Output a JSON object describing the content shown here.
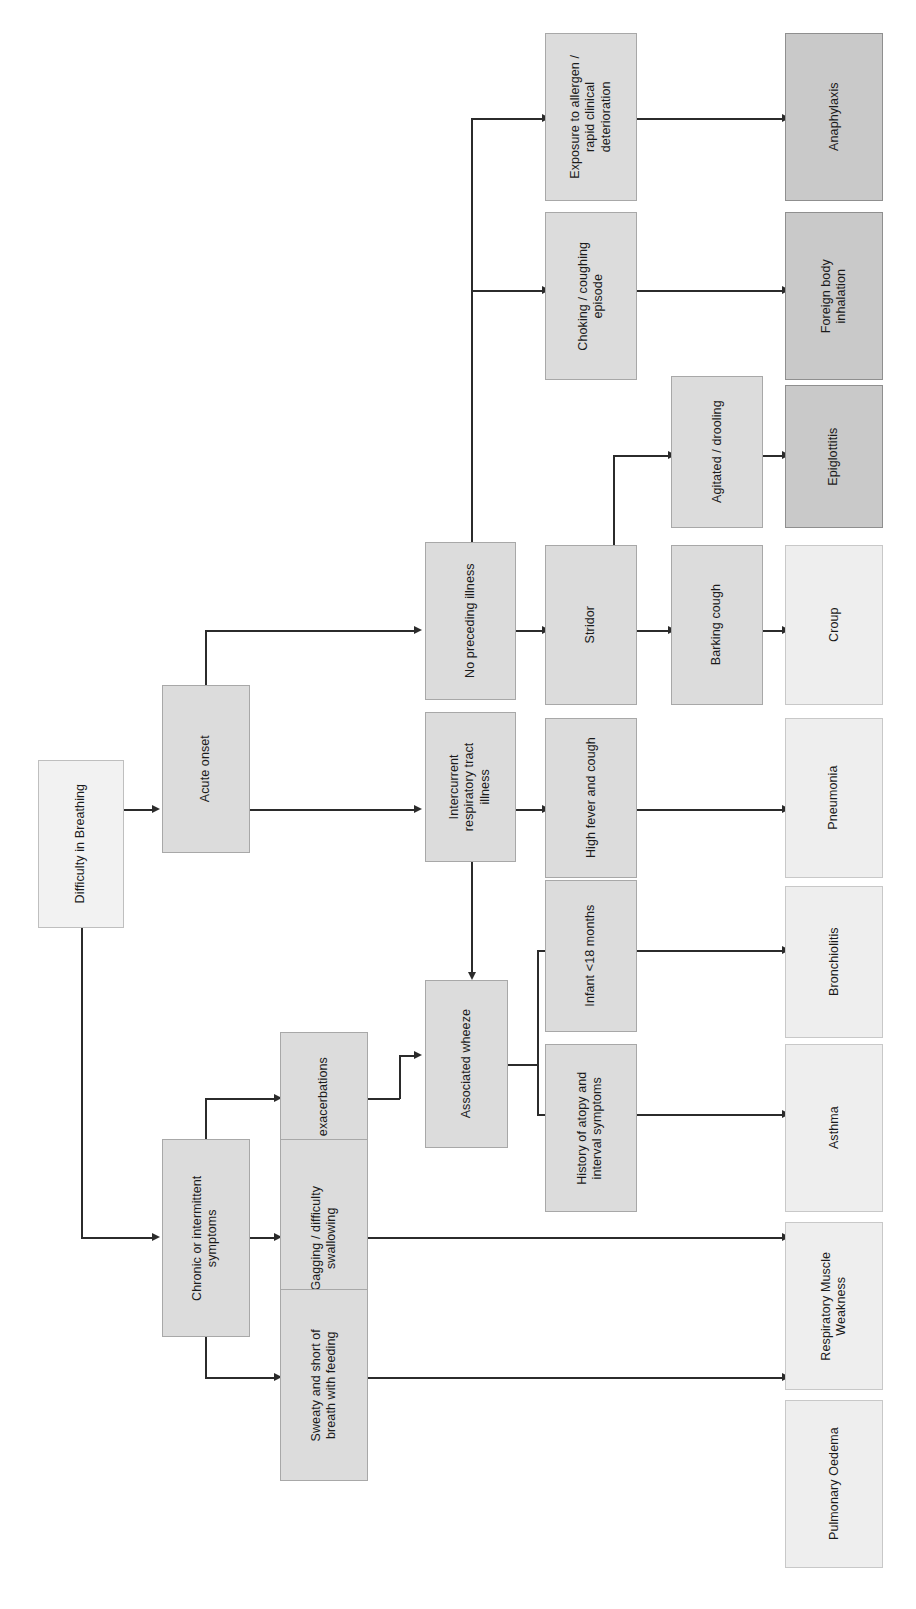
{
  "diagram": {
    "title": "Difficulty in Breathing",
    "orientation": "rotated-90-clockwise",
    "palette": {
      "root_fill": "#f2f2f2",
      "step_fill": "#dcdcdc",
      "outcome_light_fill": "#eeeeee",
      "outcome_dark_fill": "#c9c9c9",
      "border": "#a6a6a6",
      "connector": "#2b2b2b",
      "text": "#1a1a1a",
      "background": "#ffffff"
    },
    "nodes": {
      "root": {
        "label": "Difficulty in Breathing"
      },
      "acute_onset": {
        "label": "Acute onset"
      },
      "chronic": {
        "label": "Chronic or intermittent\nsymptoms"
      },
      "no_preceding": {
        "label": "No preceding illness"
      },
      "intercurrent": {
        "label": "Intercurrent\nrespiratory tract\nillness"
      },
      "acute_exac": {
        "label": "Acute exacerbations"
      },
      "gagging": {
        "label": "Gagging / difficulty\nswallowing"
      },
      "sweaty": {
        "label": "Sweaty and short of\nbreath with feeding"
      },
      "assoc_wheeze": {
        "label": "Associated wheeze"
      },
      "exposure": {
        "label": "Exposure to allergen /\nrapid clinical\ndeterioration"
      },
      "choking": {
        "label": "Choking / coughing\nepisode"
      },
      "stridor": {
        "label": "Stridor"
      },
      "high_fever": {
        "label": "High fever and cough"
      },
      "infant": {
        "label": "Infant <18 months"
      },
      "atopy": {
        "label": "History of atopy and\ninterval symptoms"
      },
      "agitated": {
        "label": "Agitated / drooling"
      },
      "barking": {
        "label": "Barking cough"
      },
      "anaphylaxis": {
        "label": "Anaphylaxis"
      },
      "foreign_body": {
        "label": "Foreign body\ninhalation"
      },
      "epiglottitis": {
        "label": "Epiglottitis"
      },
      "croup": {
        "label": "Croup"
      },
      "pneumonia": {
        "label": "Pneumonia"
      },
      "bronchiolitis": {
        "label": "Bronchiolitis"
      },
      "asthma": {
        "label": "Asthma"
      },
      "resp_muscle": {
        "label": "Respiratory Muscle\nWeakness"
      },
      "pulm_oedema": {
        "label": "Pulmonary Oedema"
      }
    },
    "edges": [
      {
        "from": "root",
        "to": "acute_onset"
      },
      {
        "from": "root",
        "to": "chronic"
      },
      {
        "from": "acute_onset",
        "to": "no_preceding"
      },
      {
        "from": "acute_onset",
        "to": "intercurrent"
      },
      {
        "from": "chronic",
        "to": "acute_exac"
      },
      {
        "from": "chronic",
        "to": "gagging"
      },
      {
        "from": "chronic",
        "to": "sweaty"
      },
      {
        "from": "no_preceding",
        "to": "exposure"
      },
      {
        "from": "no_preceding",
        "to": "choking"
      },
      {
        "from": "no_preceding",
        "to": "stridor"
      },
      {
        "from": "intercurrent",
        "to": "high_fever"
      },
      {
        "from": "intercurrent",
        "to": "assoc_wheeze"
      },
      {
        "from": "acute_exac",
        "to": "assoc_wheeze"
      },
      {
        "from": "assoc_wheeze",
        "to": "infant"
      },
      {
        "from": "assoc_wheeze",
        "to": "atopy"
      },
      {
        "from": "stridor",
        "to": "agitated"
      },
      {
        "from": "stridor",
        "to": "barking"
      },
      {
        "from": "exposure",
        "to": "anaphylaxis"
      },
      {
        "from": "choking",
        "to": "foreign_body"
      },
      {
        "from": "agitated",
        "to": "epiglottitis"
      },
      {
        "from": "barking",
        "to": "croup"
      },
      {
        "from": "high_fever",
        "to": "pneumonia"
      },
      {
        "from": "infant",
        "to": "bronchiolitis"
      },
      {
        "from": "atopy",
        "to": "asthma"
      },
      {
        "from": "gagging",
        "to": "resp_muscle"
      },
      {
        "from": "sweaty",
        "to": "pulm_oedema"
      }
    ]
  }
}
